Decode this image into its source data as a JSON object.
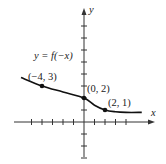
{
  "chart_data": {
    "type": "line",
    "title": "",
    "function_label": "y = f(−x)",
    "xlabel": "x",
    "ylabel": "y",
    "xlim": [
      -7,
      7
    ],
    "ylim": [
      -3,
      9
    ],
    "grid": false,
    "legend": null,
    "x_ticks": [
      -5,
      -4,
      -3,
      -2,
      -1,
      1,
      2,
      3,
      4
    ],
    "y_ticks": [
      -3,
      -2,
      -1,
      1,
      2,
      3,
      4,
      5,
      6,
      7,
      8
    ],
    "series": [
      {
        "name": "y = f(−x)",
        "x": [
          -6,
          -4,
          -2,
          0,
          1,
          2,
          3,
          4,
          5.5
        ],
        "y": [
          3.7,
          3.0,
          2.5,
          2.0,
          1.4,
          1.0,
          0.85,
          0.8,
          0.8
        ]
      }
    ],
    "labeled_points": [
      {
        "x": -4,
        "y": 3,
        "label": "(−4, 3)"
      },
      {
        "x": 0,
        "y": 2,
        "label": "(0, 2)"
      },
      {
        "x": 2,
        "y": 1,
        "label": "(2, 1)"
      }
    ]
  },
  "colors": {
    "curve": "#111111",
    "axis": "#333333",
    "text": "#222222"
  }
}
